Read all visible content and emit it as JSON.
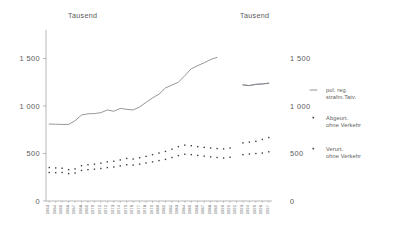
{
  "axes": {
    "unit_left": "Tausend",
    "unit_right": "Tausend",
    "y_ticks": [
      "0",
      "500",
      "1 000",
      "1 500"
    ],
    "y_tick_values": [
      0,
      500,
      1000,
      1500
    ],
    "ylim": [
      0,
      1800
    ]
  },
  "legend": {
    "items": [
      {
        "marker": "line",
        "line1": "pol. reg.",
        "line2": "strafm.Tatv."
      },
      {
        "marker": "dots",
        "line1": "Abgeurt.",
        "line2": "ohne Verkehr"
      },
      {
        "marker": "dots",
        "line1": "Verurt.",
        "line2": "ohne Verkehr"
      }
    ]
  },
  "chart_data": {
    "type": "line",
    "title": "",
    "xlabel": "",
    "ylabel": "Tausend",
    "ylim": [
      0,
      1800
    ],
    "grid": false,
    "legend_position": "right",
    "annotations": [
      "Serienbruch 1992/1993 (Wiedervereinigung)"
    ],
    "categories": [
      "1963",
      "1964",
      "1965",
      "1966",
      "1967",
      "1968",
      "1969",
      "1970",
      "1971",
      "1972",
      "1973",
      "1974",
      "1975",
      "1976",
      "1977",
      "1978",
      "1979",
      "1980",
      "1981",
      "1982",
      "1983",
      "1984",
      "1985",
      "1986",
      "1987",
      "1988",
      "1989",
      "1990",
      "1991",
      "1992",
      "1993",
      "1994",
      "1995",
      "1996",
      "1997"
    ],
    "series": [
      {
        "name": "pol. reg. strafm.Tatv.",
        "style": "line",
        "break_after": "1992",
        "values": [
          810,
          808,
          806,
          806,
          845,
          905,
          918,
          920,
          930,
          958,
          945,
          975,
          965,
          958,
          990,
          1038,
          1085,
          1125,
          1190,
          1220,
          1250,
          1320,
          1392,
          1425,
          1455,
          1490,
          1512,
          null,
          null,
          null,
          1222,
          1215,
          1228,
          1232,
          1240
        ]
      },
      {
        "name": "pol. reg. strafm.Tatv. (Gesamtdeutschland)",
        "style": "line",
        "values": [
          null,
          null,
          null,
          null,
          null,
          null,
          null,
          null,
          null,
          null,
          null,
          null,
          null,
          null,
          null,
          null,
          null,
          null,
          null,
          null,
          null,
          null,
          null,
          null,
          null,
          null,
          null,
          null,
          null,
          null,
          1222,
          1215,
          1228,
          1232,
          1240
        ]
      },
      {
        "name": "Abgeurt. ohne Verkehr",
        "style": "dots",
        "break_after": "1991",
        "values": [
          352,
          348,
          345,
          330,
          338,
          372,
          382,
          388,
          398,
          412,
          418,
          432,
          448,
          442,
          455,
          470,
          488,
          505,
          522,
          545,
          572,
          588,
          582,
          572,
          565,
          558,
          552,
          548,
          558,
          null,
          612,
          620,
          628,
          648,
          668
        ]
      },
      {
        "name": "Verurt. ohne Verkehr",
        "style": "dots",
        "break_after": "1991",
        "values": [
          300,
          298,
          300,
          288,
          295,
          322,
          330,
          335,
          342,
          352,
          358,
          370,
          382,
          378,
          388,
          400,
          412,
          425,
          438,
          458,
          478,
          492,
          488,
          480,
          472,
          465,
          458,
          452,
          460,
          null,
          488,
          495,
          500,
          505,
          518
        ]
      }
    ]
  }
}
